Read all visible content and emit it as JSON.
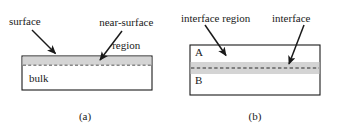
{
  "figure": {
    "type": "schematic-diagram",
    "background_color": "#ffffff",
    "stroke_color": "#1a1a1a",
    "band_fill_color": "#d4d4d4",
    "body_fill_color": "#ffffff"
  },
  "panel_a": {
    "caption": "(a)",
    "labels": {
      "surface": "surface",
      "near_surface_region_line1": "near-surface",
      "near_surface_region_line2": "region",
      "bulk": "bulk"
    },
    "geometry": {
      "rect": {
        "x": 22,
        "y": 56,
        "width": 130,
        "height": 34
      },
      "band": {
        "x": 22,
        "y": 56,
        "width": 130,
        "height": 9
      },
      "dashed_line_y": 65
    },
    "arrows": [
      {
        "name": "surface-arrow",
        "x1": 32,
        "y1": 30,
        "x2": 57,
        "y2": 55
      },
      {
        "name": "near-surface-region-arrow",
        "x1": 121,
        "y1": 31,
        "x2": 99,
        "y2": 62
      }
    ]
  },
  "panel_b": {
    "caption": "(b)",
    "labels": {
      "interface_region": "interface region",
      "interface": "interface",
      "phase_a": "A",
      "phase_b": "B"
    },
    "geometry": {
      "rect": {
        "x": 21,
        "y": 45,
        "width": 130,
        "height": 50
      },
      "band": {
        "x": 21,
        "y": 62,
        "width": 130,
        "height": 12
      },
      "dashed_line_y": 68
    },
    "arrows": [
      {
        "name": "interface-region-arrow",
        "x1": 36,
        "y1": 26,
        "x2": 58,
        "y2": 57
      },
      {
        "name": "interface-arrow",
        "x1": 134,
        "y1": 26,
        "x2": 120,
        "y2": 66
      }
    ]
  }
}
